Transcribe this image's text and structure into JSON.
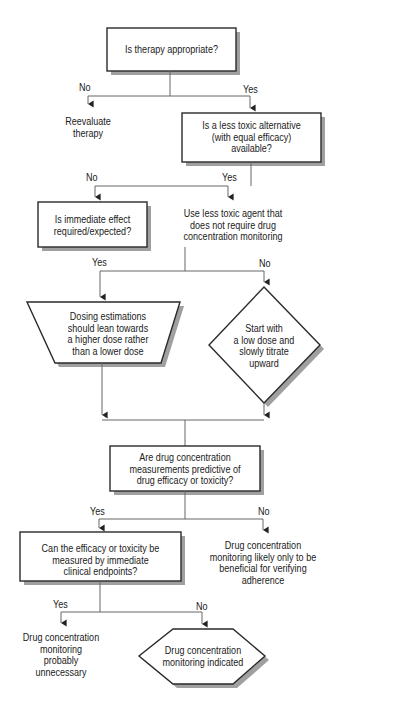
{
  "diagram": {
    "type": "flowchart",
    "nodes": {
      "q_therapy": {
        "shape": "rectangle",
        "text": "Is therapy appropriate?"
      },
      "reevaluate": {
        "shape": "text",
        "text": "Reevaluate\ntherapy"
      },
      "q_less_toxic": {
        "shape": "rectangle",
        "text": "Is a less toxic alternative\n(with equal efficacy)\navailable?"
      },
      "use_less_toxic": {
        "shape": "text",
        "text": "Use less toxic agent that\ndoes not require drug\nconcentration monitoring"
      },
      "q_immediate": {
        "shape": "rectangle",
        "text": "Is immediate effect\nrequired/expected?"
      },
      "higher_dose": {
        "shape": "trapezoid",
        "text": "Dosing estimations\nshould lean towards\na higher dose rather\nthan a lower dose"
      },
      "low_dose": {
        "shape": "diamond",
        "text": "Start with\na low dose and\nslowly titrate\nupward"
      },
      "q_predictive": {
        "shape": "rectangle",
        "text": "Are drug concentration\nmeasurements predictive of\ndrug efficacy or toxicity?"
      },
      "adherence": {
        "shape": "text",
        "text": "Drug concentration\nmonitoring likely only to be\nbeneficial for verifying\nadherence"
      },
      "q_endpoints": {
        "shape": "rectangle",
        "text": "Can the efficacy or toxicity be\nmeasured by immediate\nclinical endpoints?"
      },
      "unnecessary": {
        "shape": "text",
        "text": "Drug concentration\nmonitoring probably\nunnecessary"
      },
      "indicated": {
        "shape": "hexagon",
        "text": "Drug concentration\nmonitoring indicated"
      }
    },
    "edge_labels": {
      "therapy_no": "No",
      "therapy_yes": "Yes",
      "less_toxic_no": "No",
      "less_toxic_yes": "Yes",
      "immediate_yes": "Yes",
      "immediate_no": "No",
      "predictive_yes": "Yes",
      "predictive_no": "No",
      "endpoints_yes": "Yes",
      "endpoints_no": "No"
    },
    "colors": {
      "stroke": "#2a2a2a",
      "line": "#555555",
      "shadow": "#9a9a9a",
      "fill": "#ffffff"
    }
  }
}
